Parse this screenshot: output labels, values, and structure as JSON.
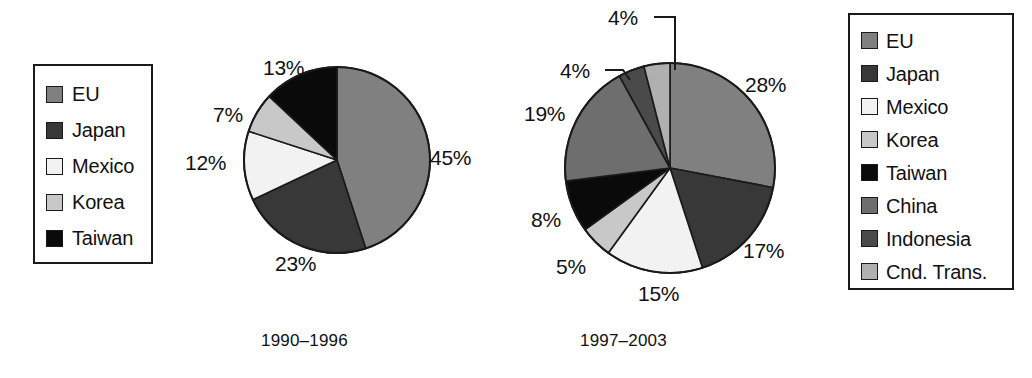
{
  "figure": {
    "background_color": "#ffffff",
    "outline_color": "#1a1a1a"
  },
  "palette": {
    "eu": "#808080",
    "japan": "#383838",
    "mexico": "#f2f2f2",
    "korea": "#c8c8c8",
    "taiwan": "#0a0a0a",
    "china": "#6e6e6e",
    "indonesia": "#4a4a4a",
    "cnd_trans": "#b0b0b0"
  },
  "legend_left": {
    "name": "legend-1990-1996",
    "items": [
      {
        "label": "EU",
        "color": "#808080"
      },
      {
        "label": "Japan",
        "color": "#383838"
      },
      {
        "label": "Mexico",
        "color": "#f2f2f2"
      },
      {
        "label": "Korea",
        "color": "#c8c8c8"
      },
      {
        "label": "Taiwan",
        "color": "#0a0a0a"
      }
    ]
  },
  "legend_right": {
    "name": "legend-1997-2003",
    "items": [
      {
        "label": "EU",
        "color": "#808080"
      },
      {
        "label": "Japan",
        "color": "#383838"
      },
      {
        "label": "Mexico",
        "color": "#f2f2f2"
      },
      {
        "label": "Korea",
        "color": "#c8c8c8"
      },
      {
        "label": "Taiwan",
        "color": "#0a0a0a"
      },
      {
        "label": "China",
        "color": "#6e6e6e"
      },
      {
        "label": "Indonesia",
        "color": "#4a4a4a"
      },
      {
        "label": "Cnd. Trans.",
        "color": "#b0b0b0"
      }
    ]
  },
  "captions": {
    "left": "1990–1996",
    "right": "1997–2003"
  },
  "chart_data": [
    {
      "type": "pie",
      "name": "pie-1990-1996",
      "title": "1990–1996",
      "units": "percent",
      "start_angle_deg": 0,
      "direction": "clockwise",
      "labels": [
        "EU",
        "Japan",
        "Mexico",
        "Korea",
        "Taiwan"
      ],
      "values": [
        45,
        23,
        12,
        7,
        13
      ],
      "value_labels": [
        "45%",
        "23%",
        "12%",
        "7%",
        "13%"
      ],
      "colors": [
        "#808080",
        "#383838",
        "#f2f2f2",
        "#c8c8c8",
        "#0a0a0a"
      ],
      "legend_position": "left",
      "grid": false
    },
    {
      "type": "pie",
      "name": "pie-1997-2003",
      "title": "1997–2003",
      "units": "percent",
      "start_angle_deg": 0,
      "direction": "clockwise",
      "labels": [
        "EU",
        "Japan",
        "Mexico",
        "Korea",
        "Taiwan",
        "China",
        "Indonesia",
        "Cnd. Trans."
      ],
      "values": [
        28,
        17,
        15,
        5,
        8,
        19,
        4,
        4
      ],
      "value_labels": [
        "28%",
        "17%",
        "15%",
        "5%",
        "8%",
        "19%",
        "4%",
        "4%"
      ],
      "colors": [
        "#808080",
        "#383838",
        "#f2f2f2",
        "#c8c8c8",
        "#0a0a0a",
        "#6e6e6e",
        "#4a4a4a",
        "#b0b0b0"
      ],
      "legend_position": "right",
      "leader_lines": [
        "Indonesia",
        "Cnd. Trans."
      ],
      "grid": false
    }
  ],
  "pie_left_labels": {
    "eu": "45%",
    "japan": "23%",
    "mexico": "12%",
    "korea": "7%",
    "taiwan": "13%"
  },
  "pie_right_labels": {
    "eu": "28%",
    "japan": "17%",
    "mexico": "15%",
    "korea": "5%",
    "taiwan": "8%",
    "china": "19%",
    "indonesia": "4%",
    "cnd_trans": "4%"
  }
}
